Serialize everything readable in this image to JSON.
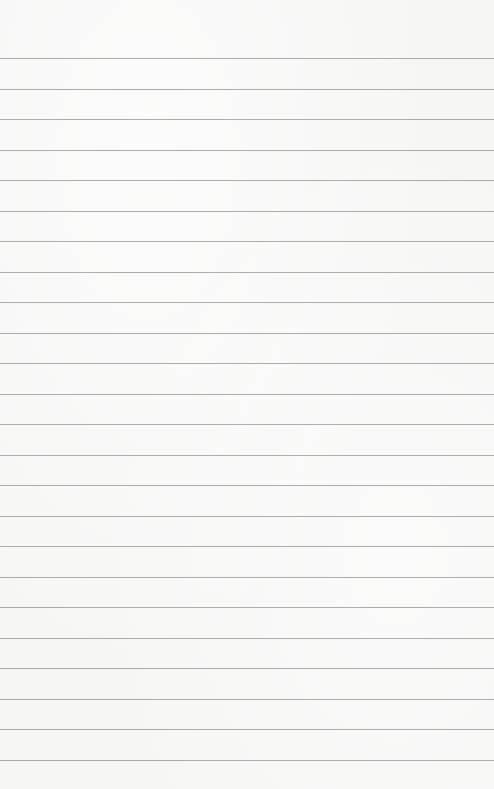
{
  "paper": {
    "type": "lined-paper",
    "background_color": "#f6f6f5",
    "line_color": "#a3a3a3",
    "first_line_y": 58,
    "line_spacing": 30.5,
    "line_count": 24,
    "text": ""
  }
}
